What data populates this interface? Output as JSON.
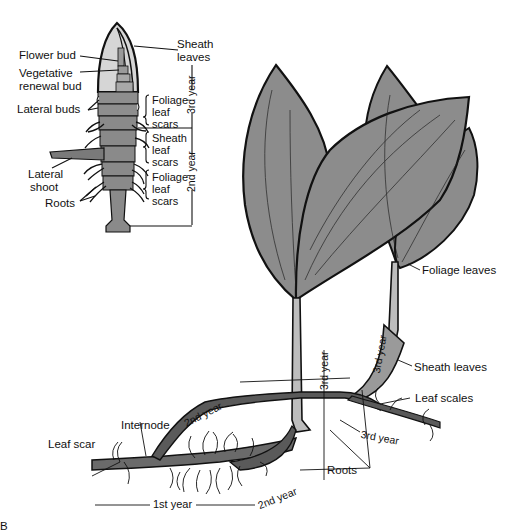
{
  "figure": {
    "panel_letter": "B",
    "inset": {
      "labels": {
        "flower_bud": "Flower bud",
        "vegetative_renewal_bud_line1": "Vegetative",
        "vegetative_renewal_bud_line2": "renewal bud",
        "lateral_buds": "Lateral buds",
        "lateral_shoot_line1": "Lateral",
        "lateral_shoot_line2": "shoot",
        "roots": "Roots",
        "sheath_leaves_line1": "Sheath",
        "sheath_leaves_line2": "leaves",
        "foliage_leaf_scars_top": [
          "Foliage",
          "leaf",
          "scars"
        ],
        "sheath_leaf_scars": [
          "Sheath",
          "leaf",
          "scars"
        ],
        "foliage_leaf_scars_bottom": [
          "Foliage",
          "leaf",
          "scars"
        ],
        "year_3rd": "3rd year",
        "year_2nd": "2nd year"
      }
    },
    "main": {
      "labels": {
        "foliage_leaves": "Foliage leaves",
        "sheath_leaves": "Sheath leaves",
        "leaf_scales": "Leaf scales",
        "roots": "Roots",
        "internode": "Internode",
        "leaf_scar": "Leaf scar",
        "year_1st": "1st year",
        "year_2nd_upper": "2nd year",
        "year_2nd_lower": "2nd year",
        "year_3rd_vertical_left": "3rd year",
        "year_3rd_vertical_right": "3rd year",
        "year_3rd_right": "3rd year"
      }
    },
    "colors": {
      "leaf_fill": "#8c8c8c",
      "bud_light": "#d6d6d6",
      "bud_mid": "#9a9a9a",
      "ink": "#111111"
    }
  }
}
